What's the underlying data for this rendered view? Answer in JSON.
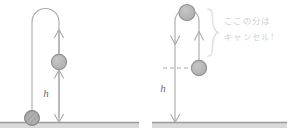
{
  "figure": {
    "title": "",
    "background_color": "#ffffff",
    "palette": {
      "line": "#a8a8a8",
      "ball_fill": "#b4b4b4",
      "ball_stroke": "#8f8f8f",
      "ground_line": "#9a9a9a",
      "ground_band": "#d9d9d9",
      "dashed_line": "#a8a8a8",
      "brace": "#e2e2e2",
      "annotation_text": "#d2d2d2",
      "h_label_text": "#6d6d6d"
    }
  },
  "panels": [
    {
      "id": "left-panel",
      "name": "throw-up-and-fall-diagram",
      "labels": {
        "height": "h"
      },
      "balls": [
        {
          "name": "ball-midair",
          "state": "mid-air",
          "textured": false
        },
        {
          "name": "ball-ground",
          "state": "on-ground",
          "textured": true
        }
      ],
      "arrows": [
        {
          "name": "arrow-upper-up",
          "direction": "up"
        },
        {
          "name": "arrow-lower-up",
          "direction": "up"
        },
        {
          "name": "arrow-height-down",
          "direction": "down"
        }
      ],
      "ground": {
        "name": "ground-surface"
      }
    },
    {
      "id": "right-panel",
      "name": "cancelled-segment-diagram",
      "labels": {
        "height": "h"
      },
      "balls": [
        {
          "name": "ball-apex",
          "state": "apex",
          "textured": false
        },
        {
          "name": "ball-release",
          "state": "release-level",
          "textured": false
        }
      ],
      "arrows": [
        {
          "name": "arrow-down-left",
          "direction": "down"
        },
        {
          "name": "arrow-up-right",
          "direction": "up"
        },
        {
          "name": "arrow-height-down",
          "direction": "down"
        }
      ],
      "dashed_reference": {
        "name": "release-level-dashed-line"
      },
      "brace": {
        "name": "cancel-brace"
      },
      "annotation": {
        "name": "cancel-annotation",
        "line1": "ここの分は",
        "line2": "キャンセル！"
      },
      "ground": {
        "name": "ground-surface"
      }
    }
  ]
}
